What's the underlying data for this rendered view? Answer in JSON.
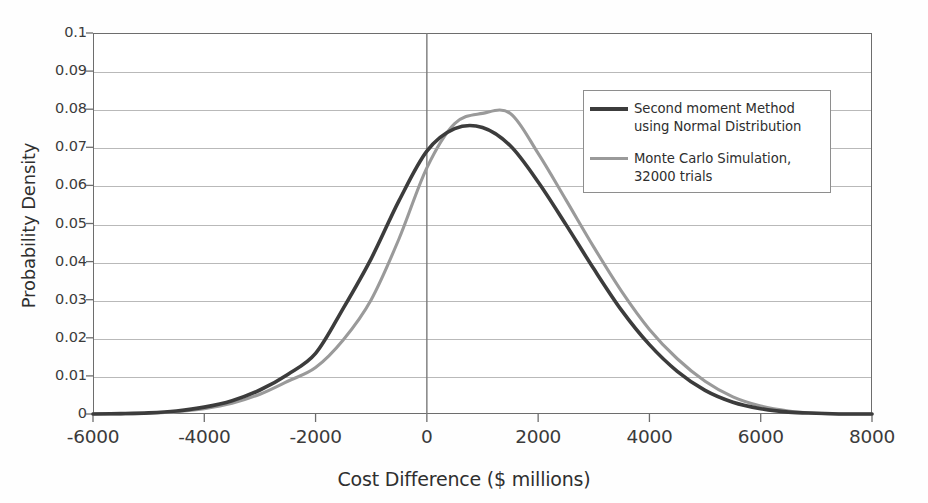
{
  "chart_data": {
    "type": "line",
    "title": "",
    "xlabel": "Cost Difference ($ millions)",
    "ylabel": "Probability Density",
    "xlim": [
      -6000,
      8000
    ],
    "ylim": [
      0,
      0.1
    ],
    "grid": true,
    "legend_position": "upper-right-inside",
    "xticks": [
      -6000,
      -4000,
      -2000,
      0,
      2000,
      4000,
      6000,
      8000
    ],
    "xtick_labels": [
      "-6000",
      "-4000",
      "-2000",
      "0",
      "2000",
      "4000",
      "6000",
      "8000"
    ],
    "yticks": [
      0,
      0.01,
      0.02,
      0.03,
      0.04,
      0.05,
      0.06,
      0.07,
      0.08,
      0.09,
      0.1
    ],
    "ytick_labels": [
      "0",
      "0.01",
      "0.02",
      "0.03",
      "0.04",
      "0.05",
      "0.06",
      "0.07",
      "0.08",
      "0.09",
      "0.1"
    ],
    "x": [
      -6000,
      -5500,
      -5000,
      -4500,
      -4000,
      -3500,
      -3000,
      -2500,
      -2000,
      -1500,
      -1000,
      -500,
      0,
      500,
      1000,
      1500,
      2000,
      2500,
      3000,
      3500,
      4000,
      4500,
      5000,
      5500,
      6000,
      6500,
      7000,
      7500,
      8000
    ],
    "series": [
      {
        "name": "Second moment Method using Normal Distribution",
        "color": "#3c3c3c",
        "width": 3.6,
        "values": [
          0.0,
          0.0001,
          0.0003,
          0.0008,
          0.0018,
          0.0035,
          0.0063,
          0.0104,
          0.0159,
          0.0278,
          0.0408,
          0.056,
          0.069,
          0.0749,
          0.0752,
          0.0704,
          0.0609,
          0.0497,
          0.0381,
          0.0272,
          0.0182,
          0.0112,
          0.0062,
          0.0031,
          0.0014,
          0.0005,
          0.0002,
          0.0,
          0.0
        ]
      },
      {
        "name": "Monte Carlo Simulation, 32000 trials",
        "color": "#9a9a9a",
        "width": 3.1,
        "values": [
          0.0,
          0.0,
          0.0002,
          0.0006,
          0.0014,
          0.0028,
          0.0052,
          0.0086,
          0.0122,
          0.0195,
          0.03,
          0.046,
          0.0646,
          0.0762,
          0.0789,
          0.0789,
          0.0684,
          0.0562,
          0.0438,
          0.0322,
          0.0222,
          0.0145,
          0.0086,
          0.0045,
          0.0021,
          0.0008,
          0.0002,
          0.0,
          0.0
        ]
      }
    ]
  },
  "legend": {
    "items": [
      {
        "label": "Second moment Method using Normal Distribution",
        "color": "#3c3c3c",
        "thickness": "4.2px"
      },
      {
        "label": "Monte Carlo Simulation, 32000 trials",
        "color": "#9a9a9a",
        "thickness": "3.1px"
      }
    ]
  },
  "axes": {
    "x_title": "Cost Difference ($ millions)",
    "y_title": "Probability Density"
  }
}
